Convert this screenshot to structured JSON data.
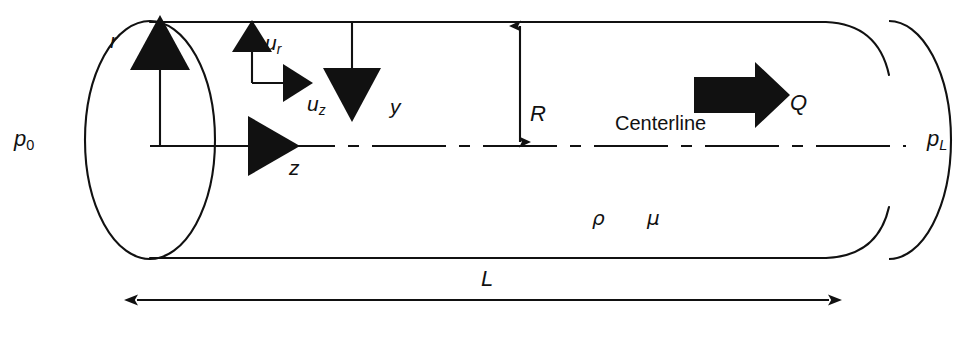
{
  "figure": {
    "kind": "pipe-flow-schematic",
    "background_color": "#ffffff",
    "ink_color": "#111111"
  },
  "labels": {
    "inlet_pressure": {
      "symbol": "p",
      "subscript": "0",
      "name": "inlet-pressure"
    },
    "outlet_pressure": {
      "symbol": "p",
      "subscript": "L",
      "name": "outlet-pressure"
    },
    "radial_axis": {
      "symbol": "r",
      "name": "radial-coordinate"
    },
    "axial_axis": {
      "symbol": "z",
      "name": "axial-coordinate"
    },
    "radial_velocity": {
      "symbol": "u",
      "subscript": "r",
      "name": "radial-velocity"
    },
    "axial_velocity": {
      "symbol": "u",
      "subscript": "z",
      "name": "axial-velocity"
    },
    "wall_distance": {
      "symbol": "y",
      "name": "wall-distance-coordinate"
    },
    "radius": {
      "symbol": "R",
      "name": "pipe-radius"
    },
    "length": {
      "symbol": "L",
      "name": "pipe-length"
    },
    "flow_rate": {
      "symbol": "Q",
      "name": "volumetric-flow-rate"
    },
    "density": {
      "symbol": "ρ",
      "name": "fluid-density"
    },
    "viscosity": {
      "symbol": "μ",
      "name": "fluid-viscosity"
    },
    "centerline": {
      "text": "Centerline",
      "name": "centerline-label"
    }
  },
  "geometry": {
    "pipe_top_wall_y": 22,
    "pipe_bottom_wall_y": 258,
    "centerline_y": 146,
    "left_end_center_x": 150,
    "left_end_rx": 65,
    "left_end_ry": 119,
    "right_end_center_x": 890,
    "right_end_rx": 62,
    "right_end_ry": 119,
    "length_dim_y": 300,
    "length_dim_x1": 130,
    "length_dim_x2": 836,
    "radius_dim_x": 520,
    "units": "px"
  }
}
